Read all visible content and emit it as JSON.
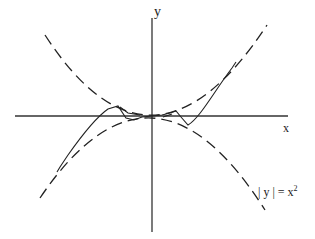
{
  "diagram": {
    "axes": {
      "x_label": "x",
      "y_label": "y"
    },
    "envelope": {
      "label_prefix": "| y | = x",
      "label_exponent": "2",
      "style": "dashed",
      "description": "Parabolas y = x^2 and y = -x^2 bounding the oscillating curve"
    },
    "curve": {
      "style": "solid",
      "description": "Oscillating function squeezed between y = x^2 and y = -x^2, tending to 0 at the origin"
    }
  }
}
